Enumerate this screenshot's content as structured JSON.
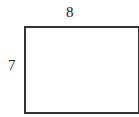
{
  "diagram": {
    "shape": "rectangle",
    "width_label": "8",
    "height_label": "7",
    "stroke_color": "#333333"
  }
}
